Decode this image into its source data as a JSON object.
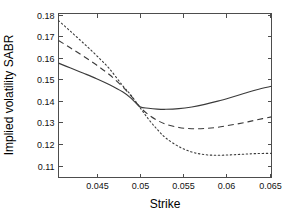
{
  "chart_data": {
    "type": "line",
    "title": "",
    "xlabel": "Strike",
    "ylabel": "Implied volatility SABR",
    "xlim": [
      0.0406,
      0.0652
    ],
    "ylim": [
      0.1045,
      0.1805
    ],
    "grid": false,
    "legend": "none",
    "xticks": [
      0.045,
      0.05,
      0.055,
      0.06,
      0.065
    ],
    "xtick_labels": [
      "0.045",
      "0.05",
      "0.055",
      "0.06",
      "0.065"
    ],
    "yticks": [
      0.11,
      0.12,
      0.13,
      0.14,
      0.15,
      0.16,
      0.17,
      0.18
    ],
    "ytick_labels": [
      "0.11",
      "0.12",
      "0.13",
      "0.14",
      "0.15",
      "0.16",
      "0.17",
      "0.18"
    ],
    "x": [
      0.0406,
      0.042,
      0.0435,
      0.045,
      0.0465,
      0.048,
      0.049,
      0.05,
      0.051,
      0.052,
      0.053,
      0.0545,
      0.056,
      0.0575,
      0.059,
      0.0605,
      0.062,
      0.0635,
      0.0652
    ],
    "series": [
      {
        "name": "solid-curve",
        "style": "solid",
        "color": "#3a3a3a",
        "values": [
          0.1575,
          0.1552,
          0.1528,
          0.1503,
          0.1475,
          0.1442,
          0.1412,
          0.1373,
          0.1366,
          0.1362,
          0.1361,
          0.1364,
          0.1372,
          0.1384,
          0.1399,
          0.1416,
          0.1434,
          0.1452,
          0.1468
        ]
      },
      {
        "name": "dashed-curve",
        "style": "dashed",
        "color": "#3a3a3a",
        "values": [
          0.168,
          0.1645,
          0.1607,
          0.1566,
          0.1521,
          0.1466,
          0.1422,
          0.1372,
          0.1336,
          0.131,
          0.1292,
          0.1277,
          0.1271,
          0.1272,
          0.1278,
          0.1288,
          0.1299,
          0.1312,
          0.1326
        ]
      },
      {
        "name": "dotted-curve",
        "style": "dotted",
        "color": "#3a3a3a",
        "values": [
          0.1772,
          0.1722,
          0.1667,
          0.161,
          0.1548,
          0.1471,
          0.1425,
          0.137,
          0.1315,
          0.1268,
          0.1228,
          0.1188,
          0.1163,
          0.1151,
          0.1148,
          0.115,
          0.1153,
          0.1156,
          0.1157
        ]
      }
    ]
  }
}
